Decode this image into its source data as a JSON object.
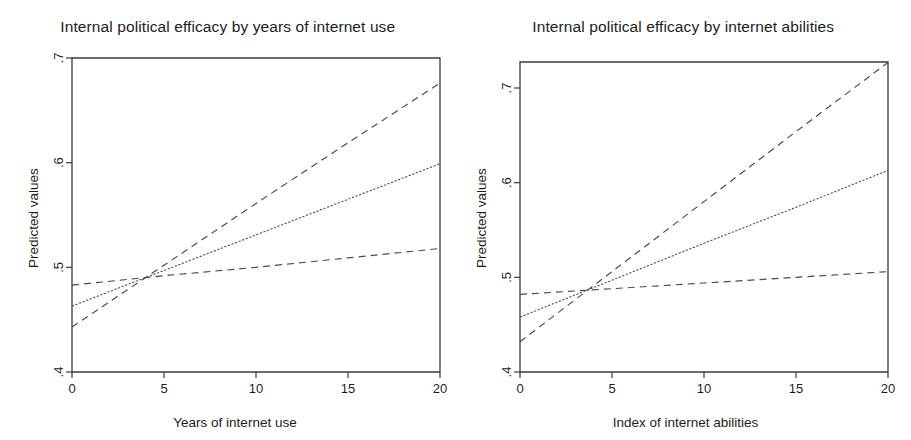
{
  "figure": {
    "background": "#ffffff",
    "line_color": "#4a4a4a",
    "axis_color": "#3b3b3b"
  },
  "panels": [
    {
      "id": "left",
      "title": "Internal political efficacy by years of internet use",
      "ylabel": "Predicted values",
      "xlabel": "Years of internet use",
      "xticks": [
        "0",
        "5",
        "10",
        "15",
        "20"
      ],
      "yticks": [
        ".4",
        ".5",
        ".6",
        ".7"
      ]
    },
    {
      "id": "right",
      "title": "Internal political efficacy by internet abilities",
      "ylabel": "Predicted values",
      "xlabel": "Index of internet abilities",
      "xticks": [
        "0",
        "5",
        "10",
        "15",
        "20"
      ],
      "yticks": [
        ".4",
        ".5",
        ".6",
        ".7"
      ]
    }
  ],
  "chart_data": [
    {
      "type": "line",
      "panel": "left",
      "title": "Internal political efficacy by years of internet use",
      "xlabel": "Years of internet use",
      "ylabel": "Predicted values",
      "xlim": [
        0,
        20
      ],
      "ylim": [
        0.4,
        0.7
      ],
      "xticks": [
        0,
        5,
        10,
        15,
        20
      ],
      "yticks": [
        0.4,
        0.5,
        0.6,
        0.7
      ],
      "grid": false,
      "legend": "none",
      "x": [
        0,
        5,
        10,
        15,
        20
      ],
      "series": [
        {
          "name": "Upper confidence bound",
          "style": "dashed",
          "values": [
            0.443,
            0.502,
            0.561,
            0.619,
            0.676
          ]
        },
        {
          "name": "Predicted value",
          "style": "solid",
          "values": [
            0.463,
            0.497,
            0.531,
            0.565,
            0.599
          ]
        },
        {
          "name": "Lower confidence bound",
          "style": "dashed",
          "values": [
            0.483,
            0.492,
            0.5,
            0.509,
            0.518
          ]
        }
      ]
    },
    {
      "type": "line",
      "panel": "right",
      "title": "Internal political efficacy by internet abilities",
      "xlabel": "Index of internet abilities",
      "ylabel": "Predicted values",
      "xlim": [
        0,
        20
      ],
      "ylim": [
        0.4,
        0.73
      ],
      "xticks": [
        0,
        5,
        10,
        15,
        20
      ],
      "yticks": [
        0.4,
        0.5,
        0.6,
        0.7
      ],
      "grid": false,
      "legend": "none",
      "x": [
        0,
        5,
        10,
        15,
        20
      ],
      "series": [
        {
          "name": "Upper confidence bound",
          "style": "dashed",
          "values": [
            0.432,
            0.506,
            0.58,
            0.654,
            0.727
          ]
        },
        {
          "name": "Predicted value",
          "style": "solid",
          "values": [
            0.458,
            0.497,
            0.536,
            0.574,
            0.613
          ]
        },
        {
          "name": "Lower confidence bound",
          "style": "dashed",
          "values": [
            0.482,
            0.488,
            0.494,
            0.5,
            0.506
          ]
        }
      ]
    }
  ]
}
